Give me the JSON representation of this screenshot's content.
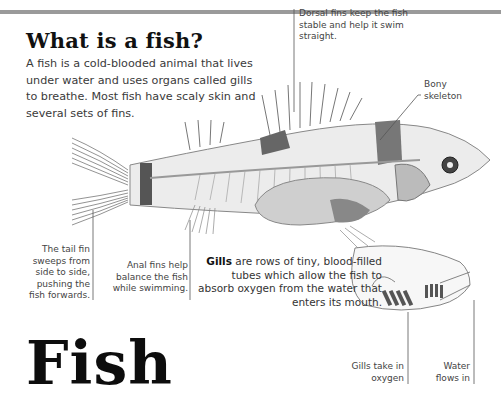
{
  "page": {
    "heading": "What is a fish?",
    "intro": "A fish is a cold-blooded animal that lives under water and uses organs called gills to breathe. Most fish have scaly skin and several sets of fins.",
    "big_title": "Fish"
  },
  "labels": {
    "dorsal": "Dorsal fins keep the fish stable and help it swim straight.",
    "bony": "Bony skeleton",
    "tail": "The tail fin sweeps from side to side, pushing the fish forwards.",
    "anal": "Anal fins help balance the fish while swimming.",
    "gills_bold": "Gills",
    "gills_rest": " are rows of tiny, blood-filled tubes which allow the fish to absorb oxygen from the water that enters its mouth.",
    "gills_take": "Gills take in oxygen",
    "water_flows": "Water flows in"
  },
  "colors": {
    "top_bar": "#9a9a9a",
    "title": "#111111",
    "body_text": "#3a3a3a"
  }
}
